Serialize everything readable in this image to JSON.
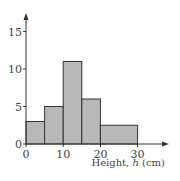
{
  "chart_data": {
    "type": "bar",
    "subtype": "histogram",
    "title": "",
    "xlabel": "Height, h (cm)",
    "xlabel_parts": {
      "prefix": "Height, ",
      "var": "h",
      "suffix": " (cm)"
    },
    "ylabel": "",
    "bins": [
      {
        "start": 0,
        "end": 5,
        "value": 3
      },
      {
        "start": 5,
        "end": 10,
        "value": 5
      },
      {
        "start": 10,
        "end": 15,
        "value": 11
      },
      {
        "start": 15,
        "end": 20,
        "value": 6
      },
      {
        "start": 20,
        "end": 30,
        "value": 2.5
      }
    ],
    "categories": [
      "0-5",
      "5-10",
      "10-15",
      "15-20",
      "20-30"
    ],
    "values": [
      3,
      5,
      11,
      6,
      2.5
    ],
    "x_ticks": [
      "0",
      "10",
      "20",
      "30"
    ],
    "y_ticks": [
      "0",
      "5",
      "10",
      "15"
    ],
    "xlim": [
      0,
      36
    ],
    "ylim": [
      0,
      17
    ],
    "grid": false,
    "legend": null,
    "bar_color": "#b8b8b8",
    "edge_color": "#333333"
  }
}
